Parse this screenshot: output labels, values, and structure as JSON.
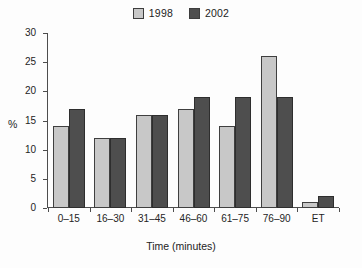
{
  "chart_data": {
    "type": "bar",
    "title": "",
    "xlabel": "Time (minutes)",
    "ylabel": "%",
    "categories": [
      "0–15",
      "16–30",
      "31–45",
      "46–60",
      "61–75",
      "76–90",
      "ET"
    ],
    "series": [
      {
        "name": "1998",
        "color": "#c8c8c8",
        "values": [
          14,
          12,
          16,
          17,
          14,
          26,
          1
        ]
      },
      {
        "name": "2002",
        "color": "#4e4e4e",
        "values": [
          17,
          12,
          16,
          19,
          19,
          19,
          2
        ]
      }
    ],
    "ylim": [
      0,
      30
    ],
    "yticks": [
      0,
      5,
      10,
      15,
      20,
      25,
      30
    ],
    "ytick_labels": [
      "0",
      "5",
      "10",
      "15",
      "20",
      "25",
      "30"
    ],
    "grid": false,
    "legend_position": "top-center",
    "bar_outline_color": "#3f3f3f",
    "axis_color": "#4d4d4d"
  },
  "legend": {
    "entries": [
      {
        "label": "1998",
        "swatch_name": "legend-swatch-1998"
      },
      {
        "label": "2002",
        "swatch_name": "legend-swatch-2002"
      }
    ]
  }
}
